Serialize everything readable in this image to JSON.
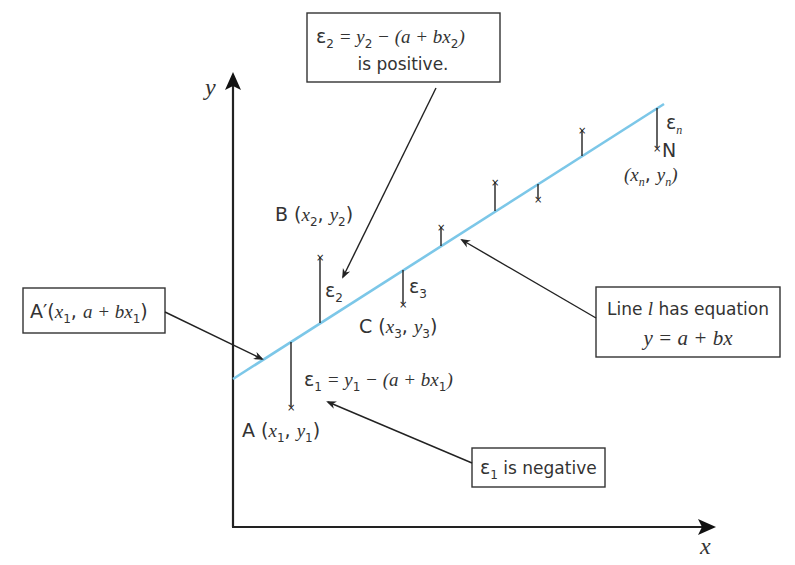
{
  "diagram": {
    "axes": {
      "x_label": "x",
      "y_label": "y"
    },
    "line": {
      "name": "l",
      "color": "#7cc7e8",
      "equation": "y = a + bx"
    },
    "callouts": {
      "eps2_box": {
        "line1_eps": "ε",
        "line1_sub": "2",
        "line1_rest": " = y",
        "line1_sub2": "2",
        "line1_tail": " − (a + bx",
        "line1_sub3": "2",
        "line1_close": ")",
        "line2": "is positive."
      },
      "a_prime_box": {
        "prefix": "A′(",
        "x": "x",
        "x_sub": "1",
        "middle": ", a + bx",
        "sub2": "1",
        "close": ")"
      },
      "line_box": {
        "line1_pre": "Line ",
        "line1_var": "l",
        "line1_post": " has equation",
        "line2": "y = a + bx"
      },
      "eps1_box": {
        "eps": "ε",
        "sub": "1",
        "text": " is negative"
      }
    },
    "points": [
      {
        "name": "A",
        "label_letter": "A",
        "label_x": "x",
        "label_xsub": "1",
        "label_y": "y",
        "label_ysub": "1",
        "residual": "ε",
        "residual_sub": "1",
        "residual_formula_rest": " = y",
        "residual_formula_sub": "1",
        "residual_formula_tail": " − (a + bx",
        "residual_formula_sub2": "1",
        "residual_formula_close": ")"
      },
      {
        "name": "B",
        "label_letter": "B",
        "label_x": "x",
        "label_xsub": "2",
        "label_y": "y",
        "label_ysub": "2",
        "residual": "ε",
        "residual_sub": "2"
      },
      {
        "name": "C",
        "label_letter": "C",
        "label_x": "x",
        "label_xsub": "3",
        "label_y": "y",
        "label_ysub": "3",
        "residual": "ε",
        "residual_sub": "3"
      },
      {
        "name": "N",
        "label_letter": "N",
        "label_x": "x",
        "label_xsub": "n",
        "label_y": "y",
        "label_ysub": "n",
        "residual": "ε",
        "residual_sub": "n"
      }
    ]
  }
}
